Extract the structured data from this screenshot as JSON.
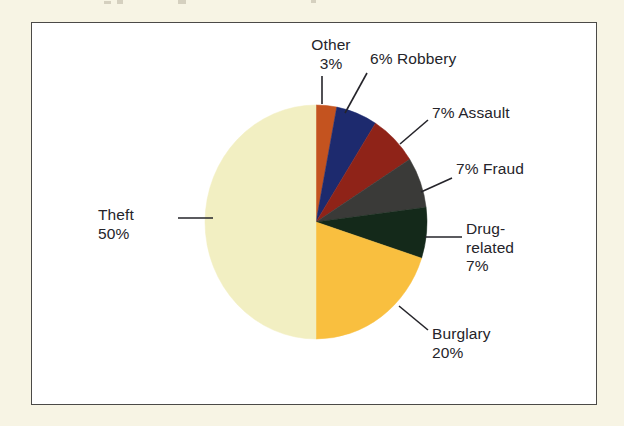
{
  "figure": {
    "frame_color": "#4b4a47",
    "plot_background": "#ffffff",
    "page_background": "#f7f4e4"
  },
  "chart_data": {
    "type": "pie",
    "title": "",
    "subtitle": "",
    "xlabel": "",
    "ylabel": "",
    "legend_position": "none",
    "grid": false,
    "units": "percent",
    "total": 100,
    "start_angle_deg": 0,
    "direction": "clockwise",
    "categories": [
      "Other",
      "Robbery",
      "Assault",
      "Fraud",
      "Drug-related",
      "Burglary",
      "Theft"
    ],
    "values": [
      3,
      6,
      7,
      7,
      7,
      20,
      50
    ],
    "colors": [
      "#c4531f",
      "#1d2a6e",
      "#8f2318",
      "#3a3a38",
      "#14291a",
      "#f9bf3f",
      "#f2efc2"
    ],
    "slices": [
      {
        "name": "Other",
        "value": 3,
        "percent_text": "3%",
        "color": "#c4531f",
        "label_text": "Other\n3%",
        "label_position": "top",
        "leader": "vertical"
      },
      {
        "name": "Robbery",
        "value": 6,
        "percent_text": "6%",
        "color": "#1d2a6e",
        "label_text": "6% Robbery",
        "label_position": "top-right",
        "leader": "diagonal"
      },
      {
        "name": "Assault",
        "value": 7,
        "percent_text": "7%",
        "color": "#8f2318",
        "label_text": "7% Assault",
        "label_position": "right-upper",
        "leader": "diagonal"
      },
      {
        "name": "Fraud",
        "value": 7,
        "percent_text": "7%",
        "color": "#3a3a38",
        "label_text": "7% Fraud",
        "label_position": "right",
        "leader": "diagonal"
      },
      {
        "name": "Drug-related",
        "value": 7,
        "percent_text": "7%",
        "color": "#14291a",
        "label_text": "Drug-\nrelated\n7%",
        "label_position": "right-lower",
        "leader": "horizontal"
      },
      {
        "name": "Burglary",
        "value": 20,
        "percent_text": "20%",
        "color": "#f9bf3f",
        "label_text": "Burglary\n20%",
        "label_position": "bottom-right",
        "leader": "diagonal"
      },
      {
        "name": "Theft",
        "value": 50,
        "percent_text": "50%",
        "color": "#f2efc2",
        "label_text": "Theft\n50%",
        "label_position": "left",
        "leader": "horizontal"
      }
    ]
  },
  "labels": {
    "other": {
      "name": "Other",
      "pct": "3%",
      "line1": "Other",
      "line2": "3%"
    },
    "robbery": {
      "name": "Robbery",
      "pct": "6%",
      "text": "6% Robbery"
    },
    "assault": {
      "name": "Assault",
      "pct": "7%",
      "text": "7% Assault"
    },
    "fraud": {
      "name": "Fraud",
      "pct": "7%",
      "text": "7% Fraud"
    },
    "drug_related": {
      "name": "Drug-related",
      "pct": "7%",
      "line1": "Drug-",
      "line2": "related",
      "line3": "7%"
    },
    "burglary": {
      "name": "Burglary",
      "pct": "20%",
      "line1": "Burglary",
      "line2": "20%"
    },
    "theft": {
      "name": "Theft",
      "pct": "50%",
      "line1": "Theft",
      "line2": "50%"
    }
  }
}
